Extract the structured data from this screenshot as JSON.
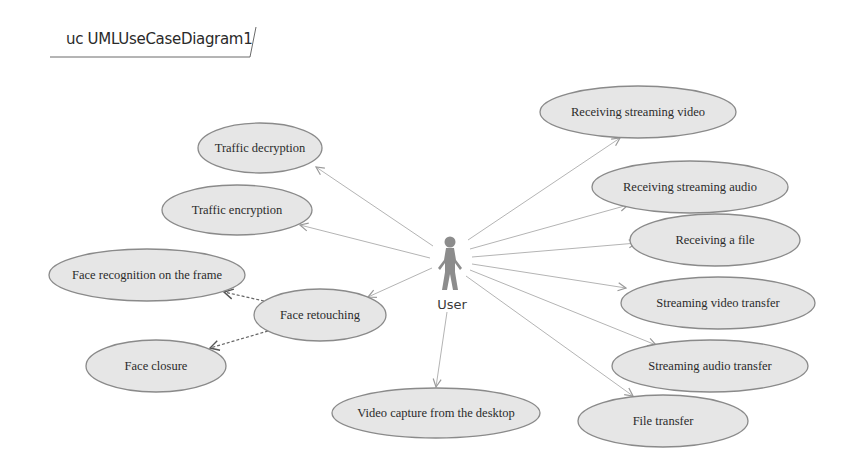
{
  "diagram": {
    "title": "uc UMLUseCaseDiagram1",
    "actor": {
      "name": "User",
      "x": 450,
      "y": 258
    },
    "colors": {
      "ellipse_fill": "#e6e6e6",
      "ellipse_stroke": "#8a8a8a",
      "line": "#b4b4b4",
      "actor": "#8c8c8c"
    },
    "use_cases": [
      {
        "id": "traffic-decryption",
        "label": "Traffic decryption",
        "cx": 260,
        "cy": 148,
        "rx": 62,
        "ry": 25
      },
      {
        "id": "traffic-encryption",
        "label": "Traffic encryption",
        "cx": 237,
        "cy": 210,
        "rx": 75,
        "ry": 25
      },
      {
        "id": "face-recognition",
        "label": "Face recognition on the frame",
        "cx": 147,
        "cy": 275,
        "rx": 98,
        "ry": 26
      },
      {
        "id": "face-retouching",
        "label": "Face retouching",
        "cx": 320,
        "cy": 315,
        "rx": 66,
        "ry": 26
      },
      {
        "id": "face-closure",
        "label": "Face closure",
        "cx": 156,
        "cy": 366,
        "rx": 70,
        "ry": 26
      },
      {
        "id": "video-capture",
        "label": "Video capture from the desktop",
        "cx": 436,
        "cy": 413,
        "rx": 104,
        "ry": 25
      },
      {
        "id": "receiving-streaming-video",
        "label": "Receiving streaming video",
        "cx": 638,
        "cy": 112,
        "rx": 98,
        "ry": 26
      },
      {
        "id": "receiving-streaming-audio",
        "label": "Receiving streaming audio",
        "cx": 690,
        "cy": 187,
        "rx": 98,
        "ry": 26
      },
      {
        "id": "receiving-a-file",
        "label": "Receiving a file",
        "cx": 715,
        "cy": 240,
        "rx": 85,
        "ry": 26
      },
      {
        "id": "streaming-video-transfer",
        "label": "Streaming video transfer",
        "cx": 718,
        "cy": 303,
        "rx": 97,
        "ry": 26
      },
      {
        "id": "streaming-audio-transfer",
        "label": "Streaming audio transfer",
        "cx": 710,
        "cy": 366,
        "rx": 98,
        "ry": 26
      },
      {
        "id": "file-transfer",
        "label": "File transfer",
        "cx": 663,
        "cy": 421,
        "rx": 85,
        "ry": 26
      }
    ],
    "associations": [
      {
        "from": "User",
        "to": "traffic-decryption",
        "x1": 433,
        "y1": 246,
        "x2": 316,
        "y2": 167
      },
      {
        "from": "User",
        "to": "traffic-encryption",
        "x1": 430,
        "y1": 258,
        "x2": 300,
        "y2": 225
      },
      {
        "from": "User",
        "to": "face-retouching",
        "x1": 432,
        "y1": 268,
        "x2": 368,
        "y2": 297
      },
      {
        "from": "User",
        "to": "video-capture",
        "x1": 447,
        "y1": 312,
        "x2": 436,
        "y2": 387
      },
      {
        "from": "User",
        "to": "receiving-streaming-video",
        "x1": 468,
        "y1": 240,
        "x2": 620,
        "y2": 138
      },
      {
        "from": "User",
        "to": "receiving-streaming-audio",
        "x1": 470,
        "y1": 249,
        "x2": 628,
        "y2": 205
      },
      {
        "from": "User",
        "to": "receiving-a-file",
        "x1": 472,
        "y1": 257,
        "x2": 637,
        "y2": 243
      },
      {
        "from": "User",
        "to": "streaming-video-transfer",
        "x1": 472,
        "y1": 264,
        "x2": 626,
        "y2": 288
      },
      {
        "from": "User",
        "to": "streaming-audio-transfer",
        "x1": 470,
        "y1": 270,
        "x2": 656,
        "y2": 345
      },
      {
        "from": "User",
        "to": "file-transfer",
        "x1": 466,
        "y1": 276,
        "x2": 633,
        "y2": 396
      }
    ],
    "dependencies": [
      {
        "from": "face-retouching",
        "to": "face-recognition",
        "x1": 264,
        "y1": 301,
        "x2": 224,
        "y2": 292
      },
      {
        "from": "face-retouching",
        "to": "face-closure",
        "x1": 268,
        "y1": 331,
        "x2": 210,
        "y2": 348
      }
    ]
  }
}
